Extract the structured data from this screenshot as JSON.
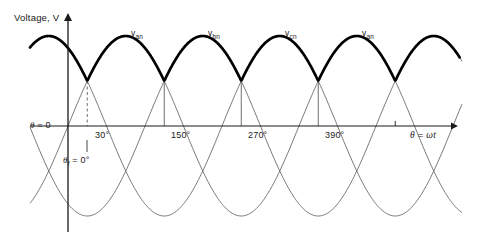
{
  "figure": {
    "y_axis_label": "Voltage, V",
    "x_axis_label": "θ = ωt",
    "origin_label": "θ = 0",
    "firing_angle_label": "θ₁ = 0°",
    "firing_angle_label_plain": "θf = 0°"
  },
  "wave_labels": [
    {
      "id": "van-1",
      "text": "v",
      "sub": "an",
      "x": 131,
      "y": 28
    },
    {
      "id": "vbn-1",
      "text": "v",
      "sub": "bn",
      "x": 208,
      "y": 28
    },
    {
      "id": "vcn-1",
      "text": "v",
      "sub": "cn",
      "x": 285,
      "y": 28
    },
    {
      "id": "van-2",
      "text": "v",
      "sub": "an",
      "x": 362,
      "y": 28
    }
  ],
  "x_ticks": [
    {
      "label": "30°",
      "degrees": 30,
      "x": 95
    },
    {
      "label": "150°",
      "degrees": 150,
      "x": 171
    },
    {
      "label": "270°",
      "degrees": 270,
      "x": 248
    },
    {
      "label": "390°",
      "degrees": 390,
      "x": 325
    },
    {
      "label": "",
      "degrees": 510,
      "x": 402
    }
  ],
  "chart_data": {
    "type": "line",
    "xlabel": "θ = ωt",
    "ylabel": "Voltage, V",
    "xlim": [
      -15,
      560
    ],
    "ylim": [
      -1.15,
      1.15
    ],
    "grid": false,
    "legend": "inline-curve-labels",
    "x_unit": "degrees",
    "amplitude": 1.0,
    "series": [
      {
        "name": "v_an",
        "phase_deg": 0,
        "color": "#3a3a3a",
        "formula": "sin(theta)"
      },
      {
        "name": "v_bn",
        "phase_deg": -120,
        "color": "#3a3a3a",
        "formula": "sin(theta - 120)"
      },
      {
        "name": "v_cn",
        "phase_deg": -240,
        "color": "#3a3a3a",
        "formula": "sin(theta - 240)"
      }
    ],
    "envelope": {
      "name": "output voltage (max of three phases)",
      "color": "#000000",
      "width": 2.6,
      "description": "Thick curve following the most positive phase; cusps at 30+120k degrees"
    },
    "cusps_deg": [
      30,
      150,
      270,
      390,
      510
    ],
    "drop_lines": [
      {
        "degrees": 30,
        "style": "dashed",
        "x": 87
      },
      {
        "degrees": 150,
        "style": "solid",
        "x": 163
      },
      {
        "degrees": 270,
        "style": "solid",
        "x": 240
      },
      {
        "degrees": 390,
        "style": "solid",
        "x": 317
      }
    ],
    "annotations": [
      {
        "text": "θ = 0",
        "at_deg": 0
      },
      {
        "text": "θf = 0°",
        "at_deg": 30
      }
    ]
  }
}
